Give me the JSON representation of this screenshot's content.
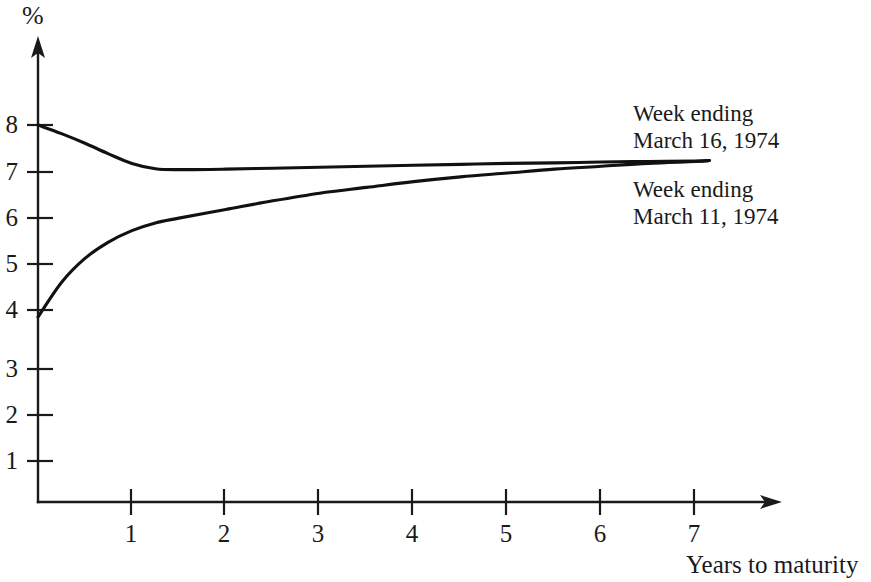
{
  "chart_data": {
    "type": "line",
    "title": "",
    "subtitle": "",
    "xlabel": "Years to maturity",
    "ylabel": "%",
    "xlim": [
      0,
      7.6
    ],
    "ylim": [
      0,
      8.7
    ],
    "grid": false,
    "legend_position": "inline-right",
    "xticks": [
      "1",
      "2",
      "3",
      "4",
      "5",
      "6",
      "7"
    ],
    "xtick_values": [
      1,
      2,
      3,
      4,
      5,
      6,
      7
    ],
    "yticks": [
      "1",
      "2",
      "3",
      "4",
      "5",
      "6",
      "7",
      "8"
    ],
    "ytick_values": [
      1,
      2,
      3,
      4,
      5,
      6,
      7,
      8
    ],
    "series": [
      {
        "name": "Week ending March 16, 1974",
        "label_line_1": "Week ending",
        "label_line_2": "March 16, 1974",
        "x": [
          0.0,
          0.25,
          0.5,
          0.75,
          1.0,
          1.25,
          1.5,
          2.0,
          2.5,
          3.0,
          3.5,
          4.0,
          4.5,
          5.0,
          5.5,
          6.0,
          6.5,
          7.0,
          7.15
        ],
        "values": [
          8.0,
          7.82,
          7.62,
          7.4,
          7.2,
          7.09,
          7.07,
          7.08,
          7.1,
          7.12,
          7.14,
          7.16,
          7.18,
          7.2,
          7.21,
          7.23,
          7.24,
          7.25,
          7.26
        ]
      },
      {
        "name": "Week ending March 11, 1974",
        "label_line_1": "Week ending",
        "label_line_2": "March 11, 1974",
        "x": [
          0.0,
          0.25,
          0.5,
          0.75,
          1.0,
          1.25,
          1.5,
          2.0,
          2.5,
          3.0,
          3.5,
          4.0,
          4.5,
          5.0,
          5.5,
          6.0,
          6.5,
          7.0,
          7.15
        ],
        "values": [
          4.0,
          4.72,
          5.22,
          5.56,
          5.8,
          5.96,
          6.06,
          6.24,
          6.42,
          6.58,
          6.7,
          6.82,
          6.92,
          7.0,
          7.08,
          7.14,
          7.2,
          7.24,
          7.26
        ]
      }
    ],
    "colors": {
      "curve": "#111111",
      "axis": "#1a1a1a",
      "background": "#ffffff"
    }
  }
}
